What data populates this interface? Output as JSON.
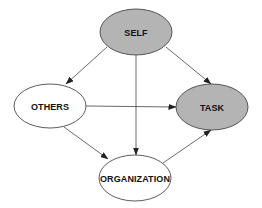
{
  "diagram": {
    "type": "directed-graph",
    "colors": {
      "shaded_fill": "#b4b4b4",
      "plain_fill": "#ffffff",
      "stroke": "#333333",
      "edge": "#444444"
    },
    "nodes": [
      {
        "id": "self",
        "label": "SELF",
        "shaded": true,
        "cx": 136,
        "cy": 32,
        "rx": 36,
        "ry": 23
      },
      {
        "id": "others",
        "label": "OTHERS",
        "shaded": false,
        "cx": 50,
        "cy": 106,
        "rx": 36,
        "ry": 22
      },
      {
        "id": "task",
        "label": "TASK",
        "shaded": true,
        "cx": 212,
        "cy": 107,
        "rx": 36,
        "ry": 23
      },
      {
        "id": "organization",
        "label": "ORGANIZATION",
        "shaded": false,
        "cx": 135,
        "cy": 178,
        "rx": 36,
        "ry": 23
      }
    ],
    "edges": [
      {
        "from": "self",
        "to": "others"
      },
      {
        "from": "self",
        "to": "organization"
      },
      {
        "from": "self",
        "to": "task"
      },
      {
        "from": "others",
        "to": "task"
      },
      {
        "from": "others",
        "to": "organization"
      },
      {
        "from": "organization",
        "to": "task"
      }
    ]
  }
}
